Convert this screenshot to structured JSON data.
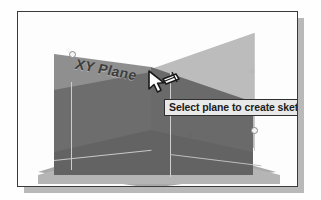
{
  "viewport": {
    "name": "cad-3d-viewport",
    "background_color": "#fdfdfd",
    "frame_border_color": "#3a3a3a",
    "shadow_color": "#b9b9b9"
  },
  "scene": {
    "label": "XY Plane",
    "selected_plane_color": "#6d6d6d",
    "unselected_plane_color": "#bcbcbc",
    "ground_plane_color": "#a9a9a9",
    "edge_color": "#cfcfcf",
    "vertex_marker_color": "#f4f4f4",
    "planes": [
      {
        "name": "XY Plane",
        "state": "selected",
        "fill": "#6d6d6d"
      },
      {
        "name": "back-right-plane",
        "state": "normal",
        "fill": "#bcbcbc"
      },
      {
        "name": "back-left-plane",
        "state": "normal",
        "fill": "#c2c2c2"
      },
      {
        "name": "ground-plane",
        "state": "normal",
        "fill": "#a9a9a9"
      }
    ]
  },
  "cursor": {
    "name": "sketch-plane-cursor",
    "icon": "pointer-with-sketch-plane-icon",
    "x": 128,
    "y": 57
  },
  "tooltip": {
    "name": "plane-selection-tooltip",
    "text": "Select plane to create sketch or",
    "background_color": "#e9e9e9",
    "border_color": "#2f2f2f",
    "truncated": true
  }
}
